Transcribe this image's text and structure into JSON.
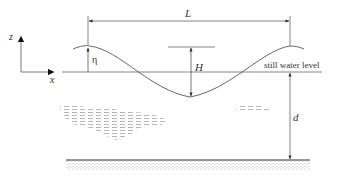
{
  "diagram": {
    "labels": {
      "z_axis": "z",
      "x_axis": "x",
      "wavelength": "L",
      "surface_elevation": "η",
      "wave_height": "H",
      "still_water_level": "still water level",
      "depth": "d"
    },
    "colors": {
      "line": "#555555",
      "text": "#333333",
      "seabed_stipple": "#9a9a9a",
      "water_texture": "#8c8c8c"
    }
  }
}
